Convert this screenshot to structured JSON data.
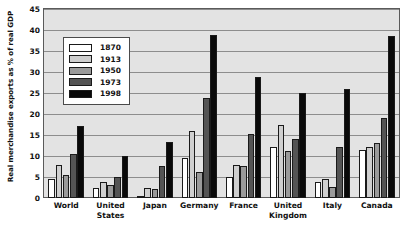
{
  "chart_data": {
    "type": "bar",
    "title": "",
    "xlabel": "",
    "ylabel": "Real merchandise exports as % of real GDP",
    "ylim": [
      0,
      45
    ],
    "yticks": [
      0,
      5,
      10,
      15,
      20,
      25,
      30,
      35,
      40,
      45
    ],
    "grid": true,
    "legend_position": "inside-top-left",
    "categories": [
      "World",
      "United States",
      "Japan",
      "Germany",
      "France",
      "United Kingdom",
      "Italy",
      "Canada"
    ],
    "series": [
      {
        "name": "1870",
        "color": "#ffffff",
        "values": [
          4.6,
          2.5,
          0.2,
          9.5,
          4.9,
          12.2,
          3.7,
          11.5
        ]
      },
      {
        "name": "1913",
        "color": "#cfcfcf",
        "values": [
          7.9,
          3.7,
          2.4,
          16.0,
          7.8,
          17.5,
          4.5,
          12.2
        ]
      },
      {
        "name": "1950",
        "color": "#9a9a9a",
        "values": [
          5.5,
          3.0,
          2.2,
          6.2,
          7.6,
          11.3,
          2.7,
          13.1
        ]
      },
      {
        "name": "1973",
        "color": "#545454",
        "values": [
          10.5,
          5.0,
          7.7,
          23.8,
          15.2,
          14.0,
          12.2,
          19.0
        ]
      },
      {
        "name": "1998",
        "color": "#090909",
        "values": [
          17.2,
          10.1,
          13.4,
          38.9,
          28.7,
          25.0,
          25.9,
          38.5
        ]
      }
    ]
  },
  "colors": {
    "plot_background": "#e3e3e3",
    "gridline": "#8d8d8d",
    "axis": "#5a5a5a",
    "text": "#111111",
    "page_background": "#ffffff"
  }
}
